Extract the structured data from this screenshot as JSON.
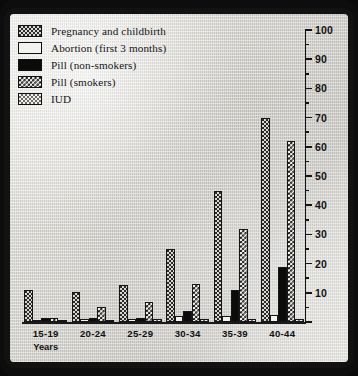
{
  "chart_data": {
    "type": "bar",
    "title": "",
    "xlabel": "Years",
    "ylabel": "",
    "ylim": [
      0,
      100
    ],
    "grid": false,
    "legend_position": "top-left",
    "categories": [
      "15-19",
      "20-24",
      "25-29",
      "30-34",
      "35-39",
      "40-44"
    ],
    "series": [
      {
        "name": "Pregnancy and childbirth",
        "pattern": "light-dotted",
        "values": [
          11.1,
          10.4,
          12.8,
          25.0,
          45.0,
          70.0
        ]
      },
      {
        "name": "Abortion (first 3 months)",
        "pattern": "white",
        "values": [
          0.7,
          1.2,
          1.2,
          2.0,
          2.2,
          2.4
        ]
      },
      {
        "name": "Pill (non-smokers)",
        "pattern": "solid-black",
        "values": [
          1.3,
          1.4,
          1.4,
          3.7,
          11.0,
          19.0
        ]
      },
      {
        "name": "Pill (smokers)",
        "pattern": "checkerboard",
        "values": [
          1.3,
          5.0,
          7.0,
          13.0,
          32.0,
          62.0
        ]
      },
      {
        "name": "IUD",
        "pattern": "dark-dotted",
        "values": [
          0.5,
          0.5,
          1.0,
          1.0,
          1.0,
          1.0
        ]
      }
    ],
    "yticks_major": [
      0,
      10,
      20,
      30,
      40,
      50,
      60,
      70,
      80,
      90,
      100
    ],
    "ytick_labels": [
      "",
      "10",
      "20",
      "30",
      "40",
      "50",
      "60",
      "70",
      "80",
      "90",
      "100"
    ],
    "yticks_minor": [
      5,
      15,
      25,
      35,
      45,
      55,
      65,
      75,
      85,
      95
    ]
  },
  "legend": {
    "items": [
      {
        "label": "Pregnancy and childbirth",
        "swatch": "swatch-pregnancy"
      },
      {
        "label": "Abortion (first 3 months)",
        "swatch": "swatch-abortion"
      },
      {
        "label": "Pill (non-smokers)",
        "swatch": "swatch-pill-nonsmokers"
      },
      {
        "label": "Pill (smokers)",
        "swatch": "swatch-pill-smokers"
      },
      {
        "label": "IUD",
        "swatch": "swatch-iud"
      }
    ]
  },
  "axis": {
    "x_caption": "Years"
  },
  "colors": {
    "frame": "#0d0d0d",
    "paper": "#cfcdc8",
    "ink": "#141414",
    "bar_black": "#0b0b0b",
    "bar_white": "#f3f2ef"
  }
}
